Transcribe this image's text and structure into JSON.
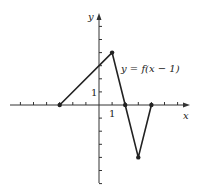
{
  "chart_data": {
    "type": "line",
    "title": "",
    "xlabel": "x",
    "ylabel": "y",
    "annotation": "y = f(x − 1)",
    "tick_labels": {
      "x": "1",
      "y": "1"
    },
    "xlim": [
      -6,
      6
    ],
    "ylim": [
      -6,
      7
    ],
    "grid": false,
    "series": [
      {
        "name": "y = f(x − 1)",
        "x": [
          -3,
          1,
          2,
          3,
          4
        ],
        "y": [
          0,
          4,
          0,
          -4,
          0
        ],
        "markers": [
          [
            -3,
            0
          ],
          [
            1,
            4
          ],
          [
            2,
            0
          ],
          [
            3,
            -4
          ],
          [
            4,
            0
          ]
        ]
      }
    ],
    "x_ticks": [
      -6,
      -5,
      -4,
      -3,
      -2,
      -1,
      1,
      2,
      3,
      4,
      5,
      6
    ],
    "y_ticks": [
      -6,
      -5,
      -4,
      -3,
      -2,
      -1,
      1,
      2,
      3,
      4,
      5,
      6
    ]
  },
  "colors": {
    "line": "#222222",
    "axis": "#333333"
  }
}
